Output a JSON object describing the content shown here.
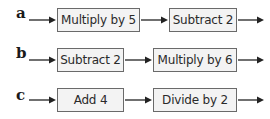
{
  "rows": [
    {
      "label": "a",
      "steps": [
        "Multiply by 5",
        "Subtract 2"
      ]
    },
    {
      "label": "b",
      "steps": [
        "Subtract 2",
        "Multiply by 6"
      ]
    },
    {
      "label": "c",
      "steps": [
        "Add 4",
        "Divide by 2"
      ]
    }
  ],
  "colors": {
    "box_fill": "#f3f3f3",
    "box_border": "#6a6a6a",
    "arrow": "#222222"
  }
}
